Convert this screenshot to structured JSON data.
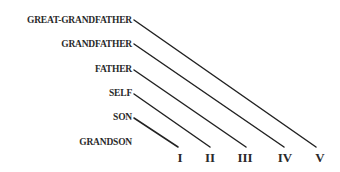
{
  "diagram": {
    "type": "kinship-degree-diagram",
    "generations": [
      {
        "label": "GREAT-GRANDFATHER",
        "top": 12,
        "line": {
          "x1": 134,
          "y1": 20,
          "x2": 316,
          "y2": 147
        }
      },
      {
        "label": "GRANDFATHER",
        "top": 36,
        "line": {
          "x1": 134,
          "y1": 44,
          "x2": 284,
          "y2": 147
        }
      },
      {
        "label": "FATHER",
        "top": 61,
        "line": {
          "x1": 134,
          "y1": 70,
          "x2": 246,
          "y2": 147
        }
      },
      {
        "label": "SELF",
        "top": 86,
        "line": {
          "x1": 134,
          "y1": 94,
          "x2": 210,
          "y2": 147
        }
      },
      {
        "label": "SON",
        "top": 110,
        "line": {
          "x1": 134,
          "y1": 118,
          "x2": 178,
          "y2": 147
        }
      },
      {
        "label": "GRANDSON",
        "top": 135,
        "line": null
      }
    ],
    "degrees": [
      {
        "label": "I",
        "x": 180
      },
      {
        "label": "II",
        "x": 210
      },
      {
        "label": "III",
        "x": 245
      },
      {
        "label": "IV",
        "x": 285
      },
      {
        "label": "V",
        "x": 320
      }
    ],
    "colors": {
      "line": "#222222",
      "text": "#2a2a2a",
      "background": "#ffffff"
    }
  }
}
